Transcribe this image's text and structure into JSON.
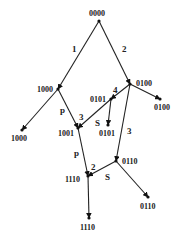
{
  "diagram": {
    "type": "state-transition-tree",
    "nodes": [
      {
        "id": "n0000",
        "label": "0000",
        "x": 99,
        "y": 21,
        "lx": 89,
        "ly": 16
      },
      {
        "id": "n1000",
        "label": "1000",
        "x": 58,
        "y": 89,
        "lx": 37,
        "ly": 92
      },
      {
        "id": "n0100",
        "label": "0100",
        "x": 130,
        "y": 84,
        "lx": 136,
        "ly": 86
      },
      {
        "id": "n0101",
        "label": "0101",
        "x": 111,
        "y": 99,
        "lx": 90,
        "ly": 102
      },
      {
        "id": "n1001",
        "label": "1001",
        "x": 78,
        "y": 128,
        "lx": 58,
        "ly": 136
      },
      {
        "id": "n0101leaf",
        "label": "0101",
        "x": 108,
        "y": 125,
        "lx": 99,
        "ly": 136
      },
      {
        "id": "n1000leaf",
        "label": "1000",
        "x": 22,
        "y": 130,
        "lx": 11,
        "ly": 141
      },
      {
        "id": "n0100leaf",
        "label": "0100",
        "x": 160,
        "y": 99,
        "lx": 154,
        "ly": 110
      },
      {
        "id": "n0110",
        "label": "0110",
        "x": 116,
        "y": 161,
        "lx": 122,
        "ly": 164
      },
      {
        "id": "n1110",
        "label": "1110",
        "x": 88,
        "y": 176,
        "lx": 65,
        "ly": 182
      },
      {
        "id": "n0110leaf",
        "label": "0110",
        "x": 148,
        "y": 197,
        "lx": 140,
        "ly": 209
      },
      {
        "id": "n1110leaf",
        "label": "1110",
        "x": 89,
        "y": 218,
        "lx": 80,
        "ly": 230
      }
    ],
    "edges": [
      {
        "from": "n0000",
        "to": "n1000",
        "label": "1",
        "lx": 72,
        "ly": 52
      },
      {
        "from": "n0000",
        "to": "n0100",
        "label": "2",
        "lx": 122,
        "ly": 52
      },
      {
        "from": "n1000",
        "to": "n1000leaf",
        "label": "",
        "lx": 0,
        "ly": 0
      },
      {
        "from": "n0100",
        "to": "n0100leaf",
        "label": "",
        "lx": 0,
        "ly": 0
      },
      {
        "from": "n0100",
        "to": "n0101",
        "label": "4",
        "lx": 113,
        "ly": 93
      },
      {
        "from": "n0101",
        "to": "n1001",
        "label": "3",
        "lx": 79,
        "ly": 120
      },
      {
        "from": "n1000",
        "to": "n1001",
        "label": "p",
        "lx": 60,
        "ly": 113
      },
      {
        "from": "n0101",
        "to": "n0101leaf",
        "label": "S",
        "lx": 95,
        "ly": 126
      },
      {
        "from": "n0100",
        "to": "n0110",
        "label": "3",
        "lx": 127,
        "ly": 134
      },
      {
        "from": "n1001",
        "to": "n1110",
        "label": "p",
        "lx": 74,
        "ly": 156
      },
      {
        "from": "n0110",
        "to": "n1110",
        "label": "S",
        "lx": 105,
        "ly": 180
      },
      {
        "from": "n1110",
        "to": "n1110leaf",
        "label": "",
        "lx": 0,
        "ly": 0
      },
      {
        "from": "n0110",
        "to": "n0110leaf",
        "label": "",
        "lx": 0,
        "ly": 0
      }
    ],
    "extra_labels": [
      {
        "text": "2",
        "x": 91,
        "y": 170
      }
    ],
    "colors": {
      "line": "#222222",
      "text": "#222222",
      "background": "#ffffff"
    }
  }
}
